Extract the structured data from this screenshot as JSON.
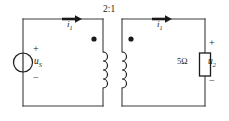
{
  "diagram": {
    "turns_ratio_label": "2:1",
    "primary": {
      "source_label": "u",
      "source_sub": "S",
      "source_plus": "+",
      "source_minus": "−",
      "current_label": "i",
      "current_sub": "1"
    },
    "secondary": {
      "current_label": "i",
      "current_sub": "1",
      "resistor_label": "5Ω",
      "voltage_label": "u",
      "voltage_sub": "2",
      "voltage_plus": "+",
      "voltage_minus": "−"
    },
    "colors": {
      "wire": "#3c3c3c",
      "ink": "#1a1a1a",
      "background": "#ffffff"
    }
  }
}
